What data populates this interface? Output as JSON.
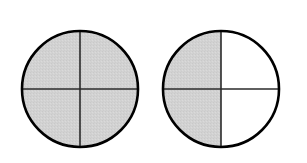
{
  "figure": {
    "background_color": "#ffffff",
    "width": 307,
    "height": 163,
    "shaded_color": "#d2d2d2",
    "unshaded_color": "#ffffff",
    "outline_color": "#000000",
    "divider_color": "#2a2a2a",
    "outline_width": 2.6,
    "divider_width": 1.6,
    "divisions": 4,
    "division_type": "quadrants"
  },
  "chart_data": {
    "type": "pie",
    "xlabel": "",
    "ylabel": "",
    "legend_position": "none",
    "grid": false,
    "shaded_color": "#d2d2d2",
    "unshaded_color": "#ffffff",
    "series": [
      {
        "name": "circle-left",
        "label": "",
        "center_x": 80,
        "center_y": 89,
        "radius": 58,
        "slices": 4,
        "shaded_count": 4,
        "fraction": "4/4",
        "values": [
          1,
          1,
          1,
          1
        ],
        "categories": [
          "upper-left",
          "upper-right",
          "lower-right",
          "lower-left"
        ],
        "states": [
          "shaded",
          "shaded",
          "shaded",
          "shaded"
        ]
      },
      {
        "name": "circle-right",
        "label": "",
        "center_x": 221,
        "center_y": 89,
        "radius": 58,
        "slices": 4,
        "shaded_count": 2,
        "fraction": "2/4",
        "values": [
          1,
          0,
          0,
          1
        ],
        "categories": [
          "upper-left",
          "upper-right",
          "lower-right",
          "lower-left"
        ],
        "states": [
          "shaded",
          "unshaded",
          "unshaded",
          "shaded"
        ]
      }
    ]
  }
}
